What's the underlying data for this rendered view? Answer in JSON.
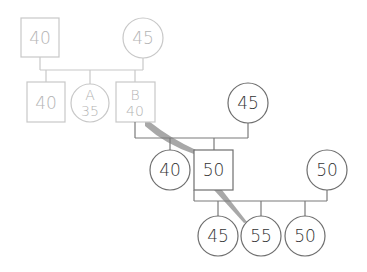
{
  "colors": {
    "faded_stroke": "#c8c8c8",
    "faded_text": "#b4b4b4",
    "active_stroke": "#6e6e6e",
    "active_text": "#333333",
    "highlight_path": "#a8a8a8"
  },
  "generation1": {
    "father": {
      "shape": "square",
      "label": "40"
    },
    "mother": {
      "shape": "circle",
      "label": "45"
    }
  },
  "generation2": {
    "sibling1": {
      "shape": "square",
      "label": "40"
    },
    "sibling_a": {
      "shape": "circle",
      "name": "A",
      "label": "35"
    },
    "sibling_b": {
      "shape": "square",
      "name": "B",
      "label": "40"
    }
  },
  "generation2_spouse": {
    "shape": "circle",
    "label": "45"
  },
  "generation3": {
    "daughter": {
      "shape": "circle",
      "label": "40"
    },
    "son": {
      "shape": "square",
      "label": "50"
    }
  },
  "generation3_spouse": {
    "shape": "circle",
    "label": "50"
  },
  "generation4": [
    {
      "shape": "circle",
      "label": "45"
    },
    {
      "shape": "circle",
      "label": "55"
    },
    {
      "shape": "circle",
      "label": "50"
    }
  ]
}
